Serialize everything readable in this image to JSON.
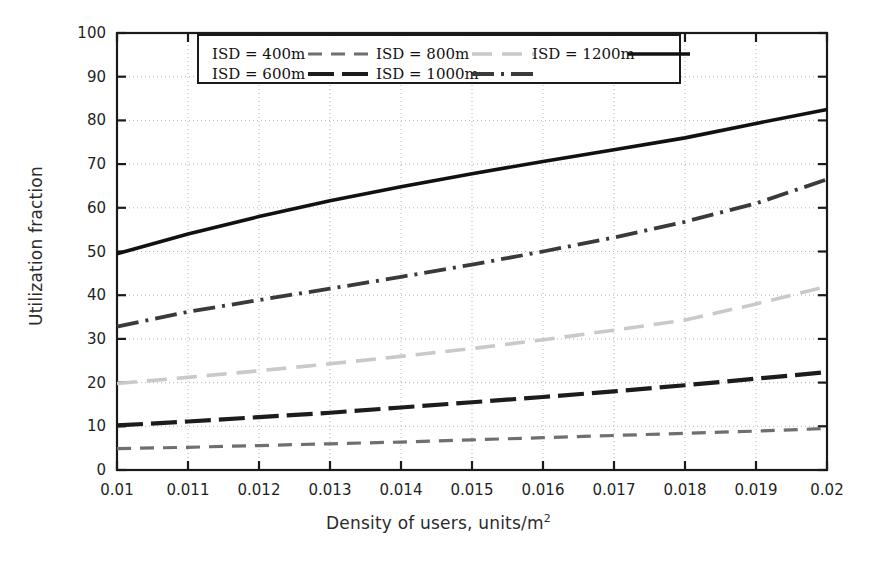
{
  "chart_data": {
    "type": "line",
    "title": "",
    "xlabel": "Density of users, units/m2",
    "xlabel_base": "Density of users, units/m",
    "xlabel_exp": "2",
    "ylabel": "Utilization fraction",
    "xlim": [
      0.01,
      0.02
    ],
    "ylim": [
      0,
      100
    ],
    "grid": true,
    "legend_position": "top-center-inside",
    "x_tick_labels": [
      "0.01",
      "0.011",
      "0.012",
      "0.013",
      "0.014",
      "0.015",
      "0.016",
      "0.017",
      "0.018",
      "0.019",
      "0.02"
    ],
    "x": [
      0.01,
      0.011,
      0.012,
      0.013,
      0.014,
      0.015,
      0.016,
      0.017,
      0.018,
      0.019,
      0.02
    ],
    "y_tick_labels": [
      "0",
      "10",
      "20",
      "30",
      "40",
      "50",
      "60",
      "70",
      "80",
      "90",
      "100"
    ],
    "y_ticks": [
      0,
      10,
      20,
      30,
      40,
      50,
      60,
      70,
      80,
      90,
      100
    ],
    "series": [
      {
        "name": "ISD = 400m",
        "values": [
          4.9,
          5.2,
          5.6,
          6.0,
          6.4,
          6.9,
          7.4,
          7.9,
          8.4,
          8.9,
          9.5
        ],
        "color": "#6f6f6f",
        "width": 3.2,
        "dash": "14,9"
      },
      {
        "name": "ISD = 600m",
        "values": [
          10.2,
          11.1,
          12.1,
          13.1,
          14.3,
          15.5,
          16.7,
          18.0,
          19.4,
          20.9,
          22.4
        ],
        "color": "#1c1c1c",
        "width": 4.2,
        "dash": "26,8"
      },
      {
        "name": "ISD = 800m",
        "values": [
          19.8,
          21.2,
          22.7,
          24.3,
          26.0,
          27.8,
          29.8,
          32.0,
          34.3,
          38.0,
          42.0
        ],
        "color": "#c9c9c9",
        "width": 3.6,
        "dash": "20,10"
      },
      {
        "name": "ISD = 1000m",
        "values": [
          32.8,
          36.2,
          38.9,
          41.5,
          44.2,
          47.0,
          50.0,
          53.2,
          56.8,
          61.0,
          66.5
        ],
        "color": "#3a3a3a",
        "width": 3.8,
        "dash": "22,7,3,7"
      },
      {
        "name": "ISD = 1200m",
        "values": [
          49.5,
          54.0,
          58.0,
          61.6,
          64.8,
          67.8,
          70.6,
          73.3,
          76.0,
          79.3,
          82.5
        ],
        "color": "#111111",
        "width": 3.6,
        "dash": "none"
      }
    ]
  },
  "legend": {
    "entries": [
      {
        "label": "ISD = 400m",
        "row": 0,
        "col": 0
      },
      {
        "label": "ISD = 800m",
        "row": 0,
        "col": 1
      },
      {
        "label": "ISD = 1200m",
        "row": 0,
        "col": 2
      },
      {
        "label": "ISD = 600m",
        "row": 1,
        "col": 0
      },
      {
        "label": "ISD = 1000m",
        "row": 1,
        "col": 1
      }
    ]
  }
}
